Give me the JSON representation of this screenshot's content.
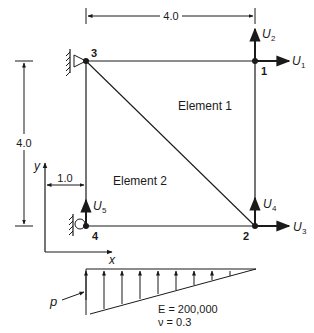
{
  "figure": {
    "dimensions": {
      "top_width": "4.0",
      "left_height": "4.0",
      "offset": "1.0"
    },
    "nodes": [
      {
        "id": "1",
        "label": "1"
      },
      {
        "id": "2",
        "label": "2"
      },
      {
        "id": "3",
        "label": "3"
      },
      {
        "id": "4",
        "label": "4"
      }
    ],
    "elements": [
      {
        "label": "Element 1"
      },
      {
        "label": "Element 2"
      }
    ],
    "dofs": {
      "u1": {
        "base": "U",
        "sub": "1"
      },
      "u2": {
        "base": "U",
        "sub": "2"
      },
      "u3": {
        "base": "U",
        "sub": "3"
      },
      "u4": {
        "base": "U",
        "sub": "4"
      },
      "u5": {
        "base": "U",
        "sub": "5"
      }
    },
    "axes": {
      "x": "x",
      "y": "y"
    },
    "load": {
      "label": "p"
    },
    "material": {
      "E": "E = 200,000",
      "nu": "ν = 0.3"
    },
    "colors": {
      "ink": "#1a1a1a",
      "background": "#ffffff"
    }
  }
}
